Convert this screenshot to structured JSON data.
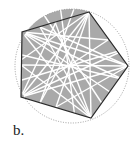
{
  "figure": {
    "label": "b.",
    "colors": {
      "fill": "#a9a9a9",
      "edge": "#2a2a2a",
      "lines": "#ffffff",
      "circle": "#888888"
    },
    "circle": {
      "cx": 72,
      "cy": 66,
      "r": 57
    },
    "vertices": [
      [
        89,
        12
      ],
      [
        22,
        32
      ],
      [
        21,
        97
      ],
      [
        91,
        118
      ],
      [
        128,
        66
      ]
    ]
  }
}
